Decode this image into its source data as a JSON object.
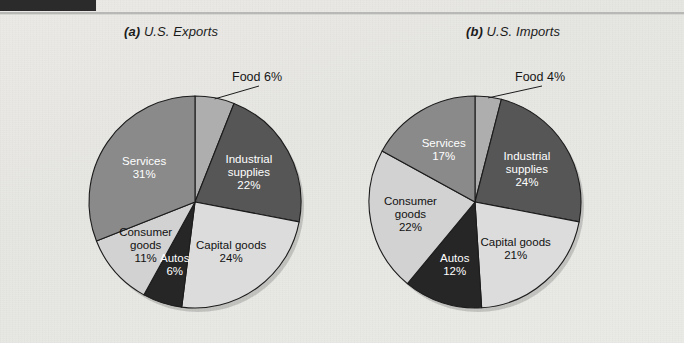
{
  "page": {
    "background_color": "#e9e9e6",
    "header_bar_color": "#2b2b2b",
    "rule_color": "#b8b8b6"
  },
  "palette": {
    "food": "#aeaeae",
    "industrial_supplies": "#565656",
    "capital_goods": "#dcdcdc",
    "autos": "#262626",
    "consumer_goods": "#d2d2d2",
    "services": "#8a8a8a",
    "outline": "#1c1c1c",
    "text_dark": "#111111",
    "text_light": "#ffffff"
  },
  "charts": [
    {
      "id": "exports",
      "panel_letter": "(a)",
      "title": "U.S. Exports",
      "callout": {
        "label": "Food 6%",
        "x": 232,
        "y": 70
      }
    },
    {
      "id": "imports",
      "panel_letter": "(b)",
      "title": "U.S. Imports",
      "callout": {
        "label": "Food 4%",
        "x": 515,
        "y": 70
      }
    }
  ],
  "chart_data": [
    {
      "type": "pie",
      "title": "(a) U.S. Exports",
      "unit": "percent",
      "categories": [
        "Food",
        "Industrial supplies",
        "Capital goods",
        "Autos",
        "Consumer goods",
        "Services"
      ],
      "values": [
        6,
        22,
        24,
        6,
        11,
        31
      ],
      "labels": [
        {
          "name": "Food",
          "value": 6,
          "text": "Food 6%",
          "placement": "callout",
          "fill": "#aeaeae"
        },
        {
          "name": "Industrial supplies",
          "value": 22,
          "text": "Industrial supplies 22%",
          "line1": "Industrial",
          "line2": "supplies",
          "line3": "22%",
          "placement": "inside",
          "fill": "#565656",
          "text_color": "#ffffff"
        },
        {
          "name": "Capital goods",
          "value": 24,
          "text": "Capital goods 24%",
          "line1": "Capital goods",
          "line2": "24%",
          "placement": "inside",
          "fill": "#dcdcdc",
          "text_color": "#111111"
        },
        {
          "name": "Autos",
          "value": 6,
          "text": "Autos 6%",
          "line1": "Autos",
          "line2": "6%",
          "placement": "inside",
          "fill": "#262626",
          "text_color": "#ffffff"
        },
        {
          "name": "Consumer goods",
          "value": 11,
          "text": "Consumer goods 11%",
          "line1": "Consumer",
          "line2": "goods",
          "line3": "11%",
          "placement": "inside",
          "fill": "#d2d2d2",
          "text_color": "#111111"
        },
        {
          "name": "Services",
          "value": 31,
          "text": "Services 31%",
          "line1": "Services",
          "line2": "31%",
          "placement": "inside",
          "fill": "#8a8a8a",
          "text_color": "#ffffff"
        }
      ],
      "legend": "none",
      "start_angle_deg": -90,
      "direction": "clockwise",
      "center": {
        "x": 195,
        "y": 202
      },
      "radius": 106
    },
    {
      "type": "pie",
      "title": "(b) U.S. Imports",
      "unit": "percent",
      "categories": [
        "Food",
        "Industrial supplies",
        "Capital goods",
        "Autos",
        "Consumer goods",
        "Services"
      ],
      "values": [
        4,
        24,
        21,
        12,
        22,
        17
      ],
      "labels": [
        {
          "name": "Food",
          "value": 4,
          "text": "Food 4%",
          "placement": "callout",
          "fill": "#aeaeae"
        },
        {
          "name": "Industrial supplies",
          "value": 24,
          "text": "Industrial supplies 24%",
          "line1": "Industrial",
          "line2": "supplies",
          "line3": "24%",
          "placement": "inside",
          "fill": "#565656",
          "text_color": "#ffffff"
        },
        {
          "name": "Capital goods",
          "value": 21,
          "text": "Capital goods 21%",
          "line1": "Capital goods",
          "line2": "21%",
          "placement": "inside",
          "fill": "#dcdcdc",
          "text_color": "#111111"
        },
        {
          "name": "Autos",
          "value": 12,
          "text": "Autos 12%",
          "line1": "Autos",
          "line2": "12%",
          "placement": "inside",
          "fill": "#262626",
          "text_color": "#ffffff"
        },
        {
          "name": "Consumer goods",
          "value": 22,
          "text": "Consumer goods 22%",
          "line1": "Consumer",
          "line2": "goods",
          "line3": "22%",
          "placement": "inside",
          "fill": "#d2d2d2",
          "text_color": "#111111"
        },
        {
          "name": "Services",
          "value": 17,
          "text": "Services 17%",
          "line1": "Services",
          "line2": "17%",
          "placement": "inside",
          "fill": "#8a8a8a",
          "text_color": "#ffffff"
        }
      ],
      "legend": "none",
      "start_angle_deg": -90,
      "direction": "clockwise",
      "center": {
        "x": 475,
        "y": 202
      },
      "radius": 106
    }
  ]
}
